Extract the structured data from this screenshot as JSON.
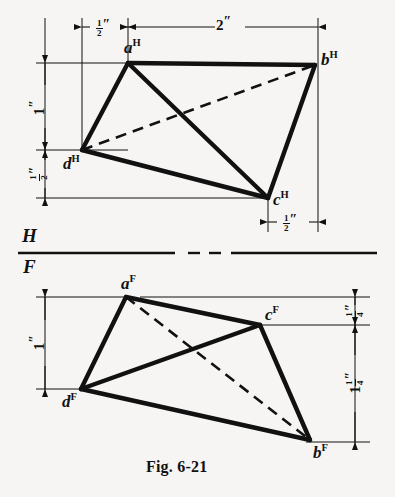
{
  "figure": {
    "caption": "Fig. 6-21",
    "background_color": "#f6f5f3",
    "ink_color": "#111111"
  },
  "planes": {
    "horizontal_label": "H",
    "frontal_label": "F"
  },
  "points": {
    "top_view": [
      {
        "name": "a-h",
        "letter": "a",
        "plane": "H",
        "x": 128,
        "y": 63
      },
      {
        "name": "b-h",
        "letter": "b",
        "plane": "H",
        "x": 315,
        "y": 65
      },
      {
        "name": "c-h",
        "letter": "c",
        "plane": "H",
        "x": 268,
        "y": 198
      },
      {
        "name": "d-h",
        "letter": "d",
        "plane": "H",
        "x": 82,
        "y": 150
      }
    ],
    "front_view": [
      {
        "name": "a-f",
        "letter": "a",
        "plane": "F",
        "x": 126,
        "y": 297
      },
      {
        "name": "b-f",
        "letter": "b",
        "plane": "F",
        "x": 310,
        "y": 440
      },
      {
        "name": "c-f",
        "letter": "c",
        "plane": "F",
        "x": 260,
        "y": 325
      },
      {
        "name": "d-f",
        "letter": "d",
        "plane": "F",
        "x": 81,
        "y": 389
      }
    ]
  },
  "edges": {
    "top_view": [
      {
        "from": "a",
        "to": "b",
        "style": "solid"
      },
      {
        "from": "a",
        "to": "d",
        "style": "solid"
      },
      {
        "from": "a",
        "to": "c",
        "style": "solid"
      },
      {
        "from": "d",
        "to": "c",
        "style": "solid"
      },
      {
        "from": "c",
        "to": "b",
        "style": "solid"
      },
      {
        "from": "d",
        "to": "b",
        "style": "dashed"
      }
    ],
    "front_view": [
      {
        "from": "a",
        "to": "c",
        "style": "solid"
      },
      {
        "from": "a",
        "to": "d",
        "style": "solid"
      },
      {
        "from": "c",
        "to": "d",
        "style": "solid"
      },
      {
        "from": "c",
        "to": "b",
        "style": "solid"
      },
      {
        "from": "d",
        "to": "b",
        "style": "solid"
      },
      {
        "from": "a",
        "to": "b",
        "style": "dashed"
      }
    ]
  },
  "dimensions": [
    {
      "name": "top-half-inch-left",
      "text": "1/2″",
      "whole": "",
      "numerator": "1",
      "denominator": "2",
      "unit": "″",
      "orientation": "horizontal",
      "view": "top"
    },
    {
      "name": "top-two-inch",
      "text": "2″",
      "whole": "2",
      "numerator": "",
      "denominator": "",
      "unit": "″",
      "orientation": "horizontal",
      "view": "top"
    },
    {
      "name": "top-one-inch-vertical",
      "text": "1″",
      "whole": "1",
      "numerator": "",
      "denominator": "",
      "unit": "″",
      "orientation": "vertical",
      "view": "top"
    },
    {
      "name": "top-half-inch-vertical",
      "text": "1/2″",
      "whole": "",
      "numerator": "1",
      "denominator": "2",
      "unit": "″",
      "orientation": "vertical",
      "view": "top"
    },
    {
      "name": "top-half-inch-bottom",
      "text": "1/2″",
      "whole": "",
      "numerator": "1",
      "denominator": "2",
      "unit": "″",
      "orientation": "horizontal",
      "view": "top"
    },
    {
      "name": "front-one-inch-vertical",
      "text": "1″",
      "whole": "1",
      "numerator": "",
      "denominator": "",
      "unit": "″",
      "orientation": "vertical",
      "view": "front"
    },
    {
      "name": "front-quarter-inch-vertical",
      "text": "1/4″",
      "whole": "",
      "numerator": "1",
      "denominator": "4",
      "unit": "″",
      "orientation": "vertical",
      "view": "front"
    },
    {
      "name": "front-one-and-quarter-inch-vertical",
      "text": "1 1/4″",
      "whole": "1",
      "numerator": "1",
      "denominator": "4",
      "unit": "″",
      "orientation": "vertical",
      "view": "front"
    }
  ]
}
